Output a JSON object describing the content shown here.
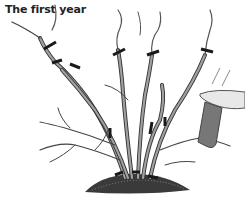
{
  "figure": {
    "caption": "The first year",
    "elements": {
      "shrub": "multi-stem shrub with cut marks",
      "pruning_shears": "hand pruner at right",
      "mound": "soil mound at base"
    },
    "colors": {
      "stem_fill": "#9a9a9a",
      "stem_outline": "#333333",
      "cut_mark": "#1a1a1a",
      "shears_blade": "#e8e8e8",
      "shears_handle": "#777777",
      "soil": "#3a3a3a"
    }
  }
}
